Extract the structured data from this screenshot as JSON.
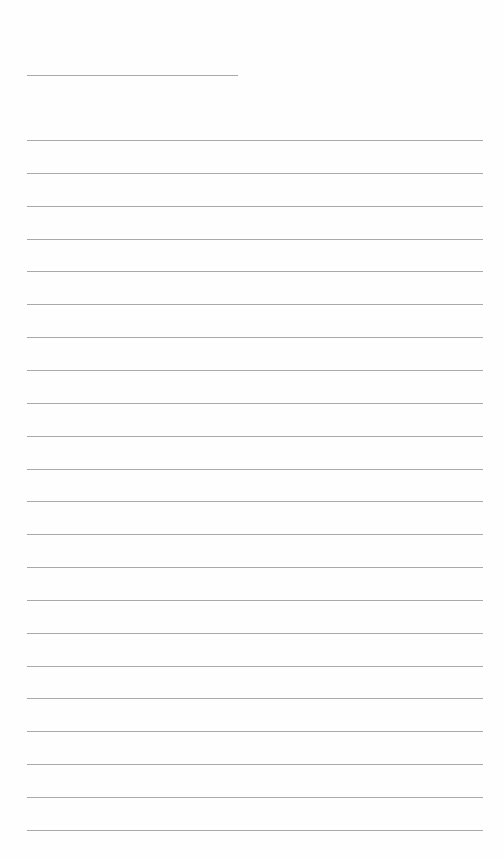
{
  "document": {
    "type": "lined-paper",
    "header_line": {
      "label": ""
    },
    "line_count": 22,
    "lines": [
      "",
      "",
      "",
      "",
      "",
      "",
      "",
      "",
      "",
      "",
      "",
      "",
      "",
      "",
      "",
      "",
      "",
      "",
      "",
      "",
      "",
      ""
    ],
    "colors": {
      "paper": "#fefefe",
      "rule": "#9a9a9a"
    }
  }
}
